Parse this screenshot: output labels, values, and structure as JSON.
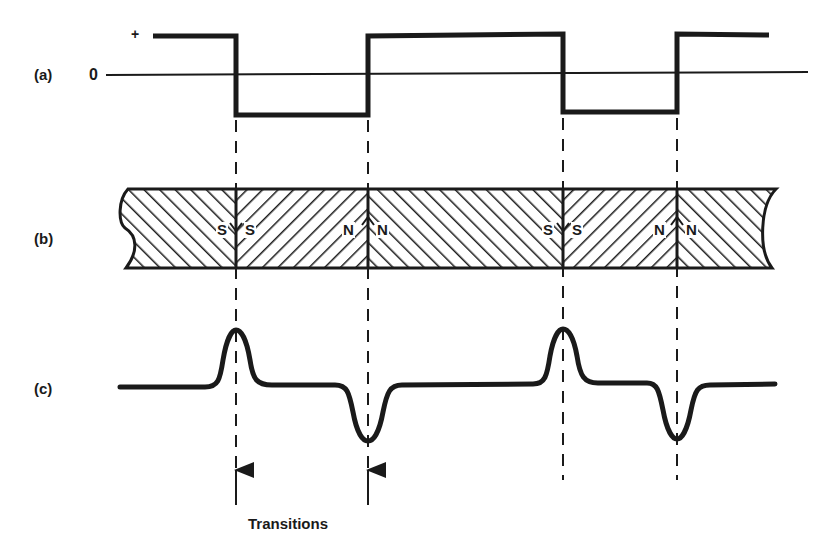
{
  "labels": {
    "a": "(a)",
    "b": "(b)",
    "c": "(c)",
    "plus": "+",
    "zero": "0",
    "transitions": "Transitions"
  },
  "transitions_x": [
    236,
    368,
    563,
    677
  ],
  "square_wave": {
    "levels": [
      "+",
      "0",
      "-"
    ],
    "sequence": [
      "+",
      "-",
      "+",
      "-",
      "+"
    ]
  },
  "magnet_strip": {
    "poles": [
      {
        "left": "S",
        "right": "S",
        "arrow": "down"
      },
      {
        "left": "N",
        "right": "N",
        "arrow": "up"
      },
      {
        "left": "S",
        "right": "S",
        "arrow": "down"
      },
      {
        "left": "N",
        "right": "N",
        "arrow": "up"
      }
    ]
  },
  "readback_pulses": [
    "positive",
    "negative",
    "positive",
    "negative"
  ],
  "colors": {
    "ink": "#1a1a1a",
    "background": "#ffffff"
  }
}
